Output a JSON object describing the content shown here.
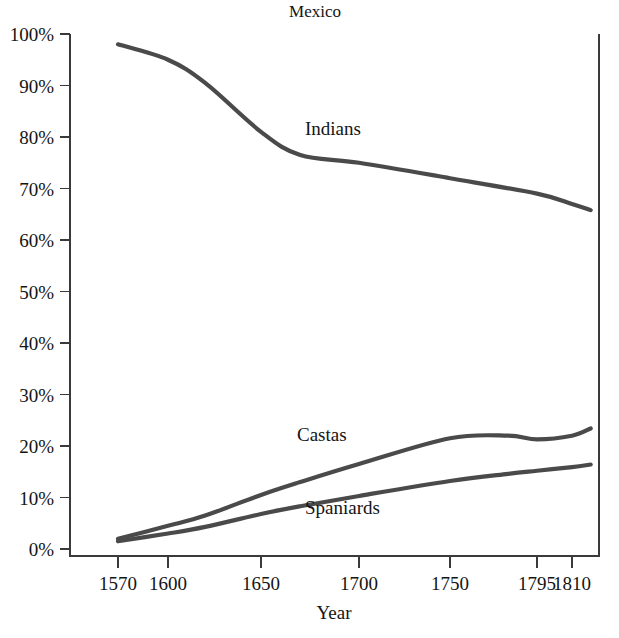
{
  "chart_data": {
    "type": "line",
    "title": "Mexico",
    "xlabel": "Year",
    "ylabel": "",
    "grid": false,
    "legend_position": "inline-labels",
    "line_color": "#4a4a4a",
    "axis_color": "#3a3a3a",
    "x_tick_labels": [
      "1570",
      "1600",
      "1650",
      "1700",
      "1750",
      "1795",
      "1810"
    ],
    "x_tick_values": [
      1570,
      1600,
      1650,
      1700,
      1750,
      1795,
      1810
    ],
    "x_tick_pixels": [
      118,
      168,
      261,
      359,
      450,
      537,
      572
    ],
    "y_tick_labels": [
      "0%",
      "10%",
      "20%",
      "30%",
      "40%",
      "50%",
      "60%",
      "70%",
      "80%",
      "90%",
      "100%"
    ],
    "y_tick_values": [
      0,
      10,
      20,
      30,
      40,
      50,
      60,
      70,
      80,
      90,
      100
    ],
    "ylim": [
      0,
      100
    ],
    "xlim_pixels": [
      70,
      599
    ],
    "ylim_pixels": [
      549,
      34
    ],
    "series": [
      {
        "name": "Indians",
        "label_x": 305,
        "label_y": 135,
        "x": [
          1570,
          1600,
          1620,
          1650,
          1670,
          1700,
          1750,
          1795,
          1810,
          1818
        ],
        "values": [
          98.0,
          95.0,
          90.5,
          81.0,
          76.5,
          75.0,
          72.0,
          69.0,
          67.0,
          65.8
        ]
      },
      {
        "name": "Castas",
        "label_x": 297,
        "label_y": 441,
        "x": [
          1570,
          1600,
          1620,
          1650,
          1670,
          1700,
          1750,
          1780,
          1795,
          1810,
          1818
        ],
        "values": [
          2.0,
          4.5,
          6.5,
          10.5,
          13.0,
          16.5,
          21.5,
          22.0,
          21.3,
          22.0,
          23.4
        ]
      },
      {
        "name": "Spaniards",
        "label_x": 305,
        "label_y": 514,
        "x": [
          1570,
          1600,
          1620,
          1650,
          1670,
          1700,
          1750,
          1780,
          1795,
          1810,
          1818
        ],
        "values": [
          1.5,
          3.0,
          4.3,
          6.8,
          8.3,
          10.3,
          13.2,
          14.6,
          15.2,
          15.9,
          16.4
        ]
      }
    ]
  }
}
